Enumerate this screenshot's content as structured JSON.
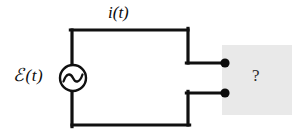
{
  "figure": {
    "background_color": "#ffffff",
    "wire_color": "#101010",
    "blackbox_fill": "#e8e8e8",
    "labels": {
      "current": "i(t)",
      "emf_symbol": "ℰ",
      "emf_argument": "(t)",
      "unknown": "?"
    },
    "source": {
      "type": "ac-voltage-source",
      "waveform": "sine",
      "center_x": 73,
      "center_y": 78,
      "radius": 13
    },
    "circuit": {
      "loop_left_x": 72,
      "loop_right_x": 188,
      "loop_top_y": 30,
      "loop_bottom_y": 125,
      "top_terminal_y": 63,
      "bottom_terminal_y": 93,
      "terminal_x": 225
    },
    "blackbox": {
      "x": 222,
      "y": 45,
      "width": 70,
      "height": 70
    }
  }
}
